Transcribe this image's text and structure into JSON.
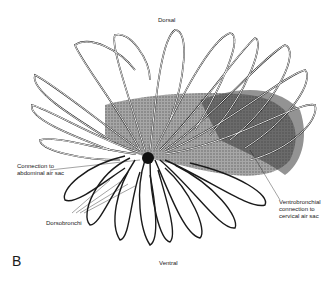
{
  "figure": {
    "panel_letter": "B",
    "labels": {
      "dorsal": "Dorsal",
      "ventral": "Ventral",
      "connection_abdominal": "Connection to\nabdominal air sac",
      "dorsobronchi": "Dorsobronchi",
      "ventrobronchial": "Ventrobronchial\nconnection to\ncervical air sac"
    },
    "colors": {
      "background": "#ffffff",
      "ink": "#1a1a1a",
      "shading": "#555555"
    }
  }
}
